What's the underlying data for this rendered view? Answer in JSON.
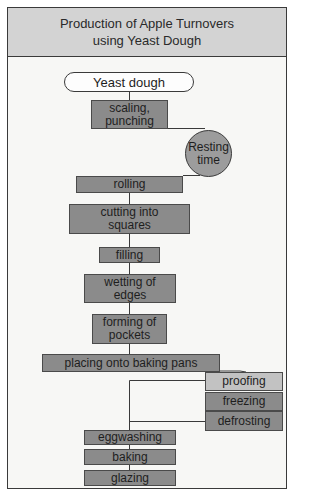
{
  "title": {
    "line1": "Production of Apple Turnovers",
    "line2": "using Yeast Dough"
  },
  "nodes": {
    "start": "Yeast dough",
    "scaling_line1": "scaling,",
    "scaling_line2": "punching",
    "resting_line1": "Resting",
    "resting_line2": "time",
    "rolling": "rolling",
    "cutting_line1": "cutting into",
    "cutting_line2": "squares",
    "filling": "filling",
    "wetting_line1": "wetting of",
    "wetting_line2": "edges",
    "forming_line1": "forming of",
    "forming_line2": "pockets",
    "placing": "placing onto baking pans",
    "proofing": "proofing",
    "freezing": "freezing",
    "defrosting": "defrosting",
    "eggwashing": "eggwashing",
    "baking": "baking",
    "glazing": "glazing"
  },
  "colors": {
    "header_bg": "#d3d3d3",
    "body_bg": "#f7f7f5",
    "step_box": "#8b8b8b",
    "proofing_box": "#c2c2c2",
    "resting_circle": "#9c9c9c",
    "border": "#3a3a3a"
  }
}
